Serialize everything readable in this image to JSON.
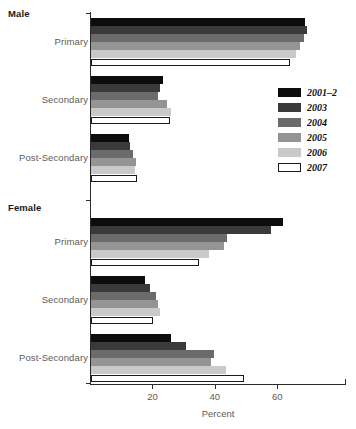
{
  "chart_data": {
    "type": "bar",
    "orientation": "horizontal",
    "title": "",
    "xlabel": "Percent",
    "ylabel": "",
    "xlim": [
      0,
      82
    ],
    "xticks": [
      20,
      40,
      60
    ],
    "xtick_labels": [
      "20",
      "40",
      "60"
    ],
    "grid": false,
    "legend_position": "right",
    "group_labels": [
      "Male",
      "Female"
    ],
    "categories": [
      "Primary",
      "Secondary",
      "Post-Secondary"
    ],
    "series": [
      {
        "name": "2001–2",
        "color": "#0d0d0d"
      },
      {
        "name": "2003",
        "color": "#3a3a3a"
      },
      {
        "name": "2004",
        "color": "#6b6b6b"
      },
      {
        "name": "2005",
        "color": "#949494"
      },
      {
        "name": "2006",
        "color": "#c9c9c9"
      },
      {
        "name": "2007",
        "color": "#ffffff"
      }
    ],
    "groups": [
      {
        "label": "Male",
        "categories": [
          {
            "label": "Primary",
            "values": [
              68.6,
              69.2,
              68.2,
              67.0,
              65.7,
              63.8
            ]
          },
          {
            "label": "Secondary",
            "values": [
              23.1,
              22.1,
              21.4,
              24.4,
              25.5,
              25.3
            ]
          },
          {
            "label": "Post-Secondary",
            "values": [
              12.3,
              12.5,
              13.3,
              14.3,
              14.1,
              14.8
            ]
          }
        ]
      },
      {
        "label": "Female",
        "categories": [
          {
            "label": "Primary",
            "values": [
              61.5,
              57.6,
              43.7,
              42.7,
              37.8,
              34.7
            ]
          },
          {
            "label": "Secondary",
            "values": [
              17.2,
              18.9,
              20.7,
              21.4,
              22.1,
              19.8
            ]
          },
          {
            "label": "Post-Secondary",
            "values": [
              25.5,
              30.3,
              39.4,
              38.5,
              43.1,
              49.0
            ]
          }
        ]
      }
    ]
  },
  "axis": {
    "x_title": "Percent",
    "tick_20": "20",
    "tick_40": "40",
    "tick_60": "60"
  },
  "labels": {
    "male": "Male",
    "female": "Female",
    "primary": "Primary",
    "secondary": "Secondary",
    "post_secondary": "Post-Secondary"
  },
  "legend": {
    "items": [
      {
        "label": "2001–2"
      },
      {
        "label": "2003"
      },
      {
        "label": "2004"
      },
      {
        "label": "2005"
      },
      {
        "label": "2006"
      },
      {
        "label": "2007"
      }
    ]
  }
}
